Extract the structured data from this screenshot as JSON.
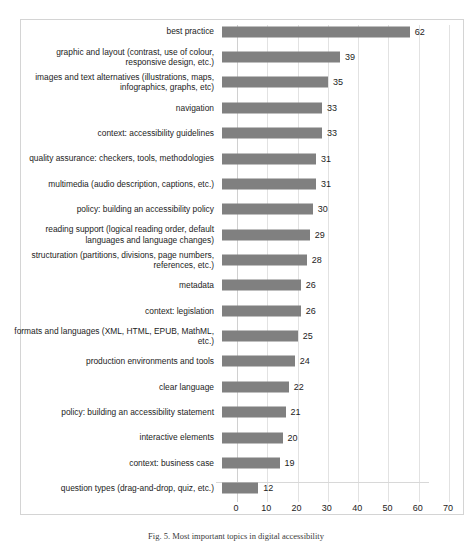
{
  "chart_data": {
    "type": "bar",
    "orientation": "horizontal",
    "title": "",
    "xlabel": "",
    "ylabel": "",
    "xlim": [
      0,
      70
    ],
    "xticks": [
      0,
      10,
      20,
      30,
      40,
      50,
      60,
      70
    ],
    "grid": true,
    "legend": false,
    "bar_color": "#808080",
    "value_labels": true,
    "categories": [
      "best practice",
      "graphic and layout (contrast, use of colour,\nresponsive design, etc.)",
      "images and text alternatives (illustrations, maps,\ninfographics, graphs, etc)",
      "navigation",
      "context: accessibility guidelines",
      "quality assurance: checkers, tools, methodologies",
      "multimedia (audio description, captions, etc.)",
      "policy: building an accessibility policy",
      "reading support (logical reading order, default\nlanguages and language changes)",
      "structuration (partitions, divisions, page numbers,\nreferences, etc.)",
      "metadata",
      "context: legislation",
      "formats and languages (XML, HTML, EPUB, MathML,\netc.)",
      "production environments and tools",
      "clear language",
      "policy: building an accessibility statement",
      "interactive elements",
      "context: business case",
      "question types (drag-and-drop, quiz, etc.)"
    ],
    "values": [
      62,
      39,
      35,
      33,
      33,
      31,
      31,
      30,
      29,
      28,
      26,
      26,
      25,
      24,
      22,
      21,
      20,
      19,
      12
    ]
  },
  "caption": {
    "text": "Fig. 5. Most important topics in digital accessibility"
  }
}
